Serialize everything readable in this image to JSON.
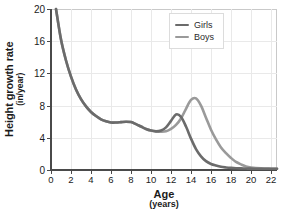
{
  "chart_data": {
    "type": "line",
    "title": "",
    "xlabel": "Age",
    "xlabel_units": "(years)",
    "ylabel": "Height growth rate",
    "ylabel_units": "(in/year)",
    "xlim": [
      0,
      22.6
    ],
    "ylim": [
      0,
      20
    ],
    "grid": true,
    "legend_position": "top-right",
    "xticks": [
      0,
      2,
      4,
      6,
      8,
      10,
      12,
      14,
      16,
      18,
      20,
      22
    ],
    "yticks": [
      0,
      4,
      8,
      12,
      16,
      20
    ],
    "xtick_labels": [
      "0",
      "2",
      "4",
      "6",
      "8",
      "10",
      "12",
      "14",
      "16",
      "18",
      "20",
      "22"
    ],
    "ytick_labels": [
      "0",
      "4",
      "8",
      "12",
      "16",
      "20"
    ],
    "x": [
      0.5,
      1,
      1.5,
      2,
      2.5,
      3,
      3.5,
      4,
      4.5,
      5,
      5.5,
      6,
      6.5,
      7,
      7.5,
      8,
      8.5,
      9,
      9.5,
      10,
      10.5,
      11,
      11.5,
      12,
      12.5,
      13,
      13.5,
      14,
      14.5,
      15,
      15.5,
      16,
      16.5,
      17,
      17.5,
      18,
      18.5,
      19,
      19.5,
      20,
      21,
      22,
      22.6
    ],
    "series": [
      {
        "name": "Girls",
        "color": "#6b6b6b",
        "values": [
          20.0,
          16.2,
          13.6,
          11.6,
          10.0,
          8.8,
          7.9,
          7.2,
          6.7,
          6.3,
          6.05,
          5.9,
          5.9,
          5.95,
          6.0,
          5.95,
          5.7,
          5.4,
          5.1,
          4.9,
          4.8,
          4.9,
          5.3,
          6.1,
          6.9,
          6.6,
          5.4,
          3.9,
          2.6,
          1.7,
          1.1,
          0.75,
          0.55,
          0.4,
          0.32,
          0.26,
          0.22,
          0.2,
          0.18,
          0.17,
          0.15,
          0.15,
          0.15
        ]
      },
      {
        "name": "Boys",
        "color": "#9a9a9a",
        "values": [
          20.0,
          16.2,
          13.6,
          11.6,
          10.0,
          8.8,
          7.9,
          7.2,
          6.7,
          6.3,
          6.05,
          5.9,
          5.9,
          5.95,
          6.0,
          5.95,
          5.7,
          5.4,
          5.1,
          4.9,
          4.8,
          4.75,
          4.8,
          5.1,
          5.6,
          6.4,
          7.6,
          8.7,
          8.9,
          8.0,
          6.5,
          5.0,
          3.8,
          2.8,
          2.1,
          1.5,
          1.0,
          0.7,
          0.45,
          0.32,
          0.2,
          0.16,
          0.15
        ]
      }
    ],
    "annotations": {
      "girls_peak_age": 12.5,
      "girls_peak_value": 6.9,
      "boys_peak_age": 14.4,
      "boys_peak_value": 8.9
    }
  },
  "legend": {
    "items": [
      {
        "label": "Girls",
        "color": "#6b6b6b"
      },
      {
        "label": "Boys",
        "color": "#9a9a9a"
      }
    ]
  },
  "colors": {
    "girls": "#6b6b6b",
    "boys": "#9a9a9a",
    "axis": "#4a4a4a",
    "grid": "#e9e9e9",
    "frame": "#c9c9c9",
    "text": "#1b1b1b",
    "background": "#ffffff"
  }
}
